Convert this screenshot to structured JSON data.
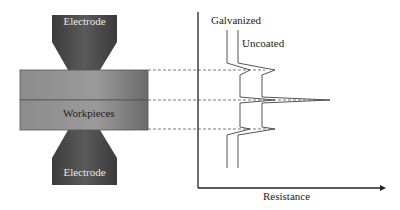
{
  "diagram": {
    "electrode_top_label": "Electrode",
    "electrode_bottom_label": "Electrode",
    "workpieces_label": "Workpieces",
    "x_axis_label": "Resistance",
    "curve_labels": {
      "galvanized": "Galvanized",
      "uncoated": "Uncoated"
    }
  },
  "colors": {
    "electrode": "#4a4a4a",
    "workpiece": "#8a8a8a",
    "line": "#333333",
    "dashed": "#555555"
  }
}
